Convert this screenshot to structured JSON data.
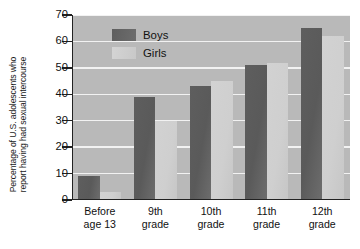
{
  "chart_data": {
    "type": "bar",
    "title": "",
    "xlabel": "",
    "ylabel": "Percentage of U.S. adolescents who report having had sexual intercourse",
    "ylabel_lines": [
      "Percentage of U.S. adolescents who",
      "report having had sexual intercourse"
    ],
    "categories": [
      "Before age 13",
      "9th grade",
      "10th grade",
      "11th grade",
      "12th grade"
    ],
    "category_lines": [
      [
        "Before",
        "age 13"
      ],
      [
        "9th",
        "grade"
      ],
      [
        "10th",
        "grade"
      ],
      [
        "11th",
        "grade"
      ],
      [
        "12th",
        "grade"
      ]
    ],
    "series": [
      {
        "name": "Boys",
        "color": "#5e5e5e",
        "values": [
          9,
          39,
          43,
          51,
          65
        ]
      },
      {
        "name": "Girls",
        "color": "#d0d0d0",
        "values": [
          3,
          30,
          45,
          52,
          62
        ]
      }
    ],
    "ylim": [
      0,
      70
    ],
    "yticks": [
      0,
      10,
      20,
      30,
      40,
      50,
      60,
      70
    ],
    "ytick_labels": [
      "0",
      "10",
      "20",
      "30",
      "40",
      "50",
      "60",
      "70"
    ],
    "grid": true,
    "grid_color": "#f2f2f2",
    "plot_background": "#b9b9b9",
    "legend_position": "top-left-inside",
    "legend": [
      "Boys",
      "Girls"
    ]
  }
}
